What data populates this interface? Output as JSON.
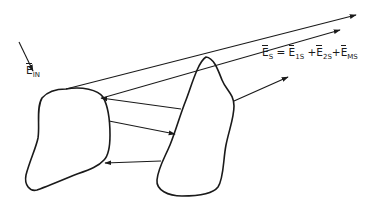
{
  "diagram": {
    "type": "scattering-schematic",
    "incident_field": {
      "symbol": "E",
      "subscript": "IN"
    },
    "equation": {
      "lhs": {
        "symbol": "E",
        "subscript": "S"
      },
      "equals": "=",
      "terms": [
        {
          "symbol": "E",
          "subscript": "1S"
        },
        {
          "symbol": "E",
          "subscript": "2S"
        },
        {
          "symbol": "E",
          "subscript": "MS"
        }
      ],
      "plus": "+"
    },
    "bodies": [
      "left-scatterer",
      "right-scatterer"
    ],
    "colors": {
      "stroke": "#1a1a1a",
      "background": "#ffffff"
    }
  }
}
